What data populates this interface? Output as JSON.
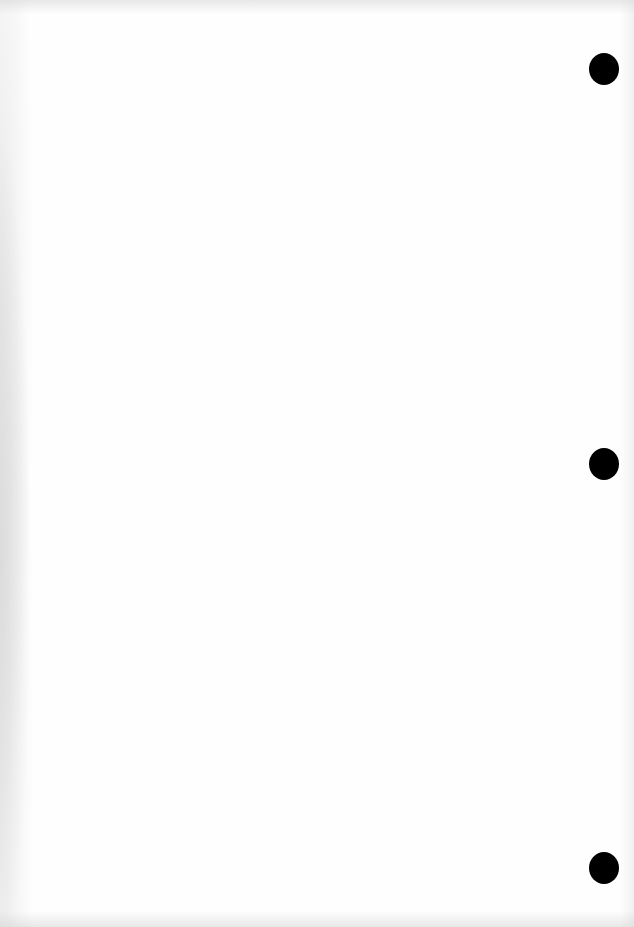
{
  "page": {
    "type": "blank scanned page",
    "background_color": "#fefefe",
    "text": ""
  },
  "punch_holes": [
    {
      "x": 589,
      "y": 53,
      "color": "#000000"
    },
    {
      "x": 589,
      "y": 448,
      "color": "#000000"
    },
    {
      "x": 589,
      "y": 852,
      "color": "#000000"
    }
  ]
}
